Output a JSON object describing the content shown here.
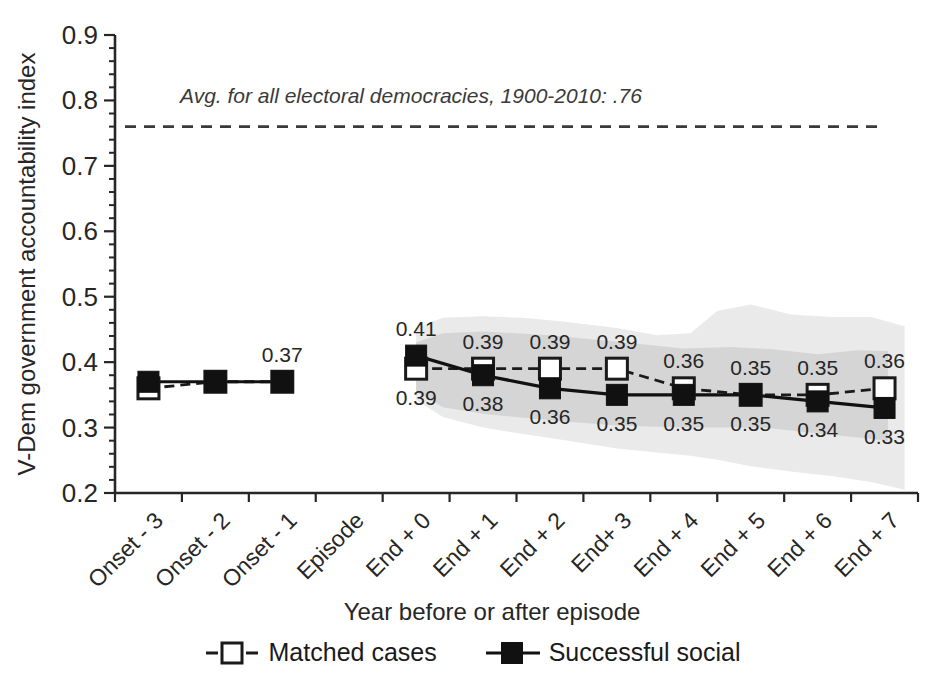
{
  "chart_data": {
    "type": "line",
    "title": "",
    "ylabel": "V-Dem government accountability index",
    "xlabel": "Year before or after episode",
    "ylim": [
      0.2,
      0.9
    ],
    "yticks": [
      "0.2",
      "0.3",
      "0.4",
      "0.5",
      "0.6",
      "0.7",
      "0.8",
      "0.9"
    ],
    "y_minor_step": 0.02,
    "grid": false,
    "legend_position": "bottom",
    "categories": [
      "Onset - 3",
      "Onset - 2",
      "Onset - 1",
      "Episode",
      "End + 0",
      "End + 1",
      "End + 2",
      "End+ 3",
      "End + 4",
      "End + 5",
      "End + 6",
      "End + 7"
    ],
    "reference_line": {
      "value": 0.76,
      "label": "Avg. for all electoral democracies, 1900-2010:  .76",
      "style": "dashed",
      "color": "#3a3a3a"
    },
    "series": [
      {
        "name": "Matched cases",
        "style": "dashed",
        "marker": "open-square",
        "color": "#1a1a1a",
        "values": [
          0.36,
          0.37,
          0.37,
          null,
          0.39,
          0.39,
          0.39,
          0.39,
          0.36,
          0.35,
          0.35,
          0.36
        ]
      },
      {
        "name": "Successful social",
        "style": "solid",
        "marker": "filled-square",
        "color": "#111111",
        "values": [
          0.37,
          0.37,
          0.37,
          null,
          0.41,
          0.38,
          0.36,
          0.35,
          0.35,
          0.35,
          0.34,
          0.33
        ]
      }
    ],
    "point_labels": [
      {
        "x": 2,
        "text": "0.37",
        "pos": "above"
      },
      {
        "x": 4,
        "text": "0.41",
        "pos": "above"
      },
      {
        "x": 4,
        "text": "0.39",
        "pos": "below"
      },
      {
        "x": 5,
        "text": "0.39",
        "pos": "above"
      },
      {
        "x": 5,
        "text": "0.38",
        "pos": "below"
      },
      {
        "x": 6,
        "text": "0.39",
        "pos": "above"
      },
      {
        "x": 6,
        "text": "0.36",
        "pos": "below"
      },
      {
        "x": 7,
        "text": "0.39",
        "pos": "above"
      },
      {
        "x": 7,
        "text": "0.35",
        "pos": "below"
      },
      {
        "x": 8,
        "text": "0.36",
        "pos": "above"
      },
      {
        "x": 8,
        "text": "0.35",
        "pos": "below"
      },
      {
        "x": 9,
        "text": "0.35",
        "pos": "above"
      },
      {
        "x": 9,
        "text": "0.35",
        "pos": "below"
      },
      {
        "x": 10,
        "text": "0.35",
        "pos": "above"
      },
      {
        "x": 10,
        "text": "0.34",
        "pos": "below"
      },
      {
        "x": 11,
        "text": "0.36",
        "pos": "above"
      },
      {
        "x": 11,
        "text": "0.33",
        "pos": "below"
      }
    ],
    "bands": [
      {
        "name": "outer-confidence-band",
        "color": "#eaeaea",
        "points": [
          {
            "x": 4.0,
            "top": 0.452,
            "bottom": 0.342
          },
          {
            "x": 4.4,
            "top": 0.468,
            "bottom": 0.316
          },
          {
            "x": 5.0,
            "top": 0.47,
            "bottom": 0.3
          },
          {
            "x": 5.6,
            "top": 0.468,
            "bottom": 0.29
          },
          {
            "x": 6.2,
            "top": 0.462,
            "bottom": 0.281
          },
          {
            "x": 7.0,
            "top": 0.452,
            "bottom": 0.268
          },
          {
            "x": 7.6,
            "top": 0.441,
            "bottom": 0.262
          },
          {
            "x": 8.1,
            "top": 0.444,
            "bottom": 0.257
          },
          {
            "x": 8.5,
            "top": 0.478,
            "bottom": 0.251
          },
          {
            "x": 9.0,
            "top": 0.488,
            "bottom": 0.241
          },
          {
            "x": 9.6,
            "top": 0.473,
            "bottom": 0.233
          },
          {
            "x": 10.2,
            "top": 0.469,
            "bottom": 0.226
          },
          {
            "x": 10.8,
            "top": 0.469,
            "bottom": 0.217
          },
          {
            "x": 11.3,
            "top": 0.455,
            "bottom": 0.205
          }
        ]
      },
      {
        "name": "inner-confidence-band",
        "color": "#d5d5d5",
        "points": [
          {
            "x": 4.0,
            "top": 0.43,
            "bottom": 0.355
          },
          {
            "x": 4.4,
            "top": 0.444,
            "bottom": 0.331
          },
          {
            "x": 5.0,
            "top": 0.447,
            "bottom": 0.321
          },
          {
            "x": 6.0,
            "top": 0.441,
            "bottom": 0.311
          },
          {
            "x": 7.0,
            "top": 0.431,
            "bottom": 0.303
          },
          {
            "x": 8.0,
            "top": 0.421,
            "bottom": 0.3
          },
          {
            "x": 8.7,
            "top": 0.423,
            "bottom": 0.3
          },
          {
            "x": 9.3,
            "top": 0.42,
            "bottom": 0.299
          },
          {
            "x": 10.0,
            "top": 0.412,
            "bottom": 0.291
          },
          {
            "x": 10.6,
            "top": 0.418,
            "bottom": 0.285
          },
          {
            "x": 11.05,
            "top": 0.417,
            "bottom": 0.28
          }
        ]
      }
    ]
  }
}
